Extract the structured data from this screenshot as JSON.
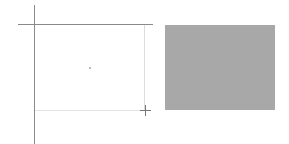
{
  "canvas": {
    "background": "#ffffff",
    "rulers": {
      "vertical_guide_color": "#8a8a8a",
      "horizontal_guide_color": "#8a8a8a"
    },
    "selection_frame": {
      "border_color": "#dcdcdc"
    },
    "cursor": {
      "icon": "crosshair-icon"
    },
    "preview_swatch": {
      "color": "#a8a8a8"
    }
  }
}
